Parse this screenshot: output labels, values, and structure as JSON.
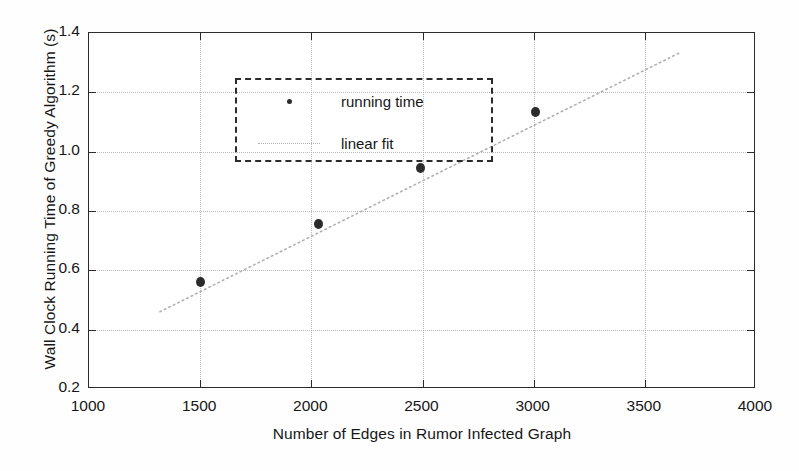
{
  "chart_data": {
    "type": "scatter",
    "title": "",
    "xlabel": "Number of Edges in Rumor Infected Graph",
    "ylabel": "Wall Clock Running Time of Greedy Algorithm (s)",
    "xlim": [
      1000,
      4000
    ],
    "ylim": [
      0.2,
      1.4
    ],
    "xticks": [
      1000,
      1500,
      2000,
      2500,
      3000,
      3500,
      4000
    ],
    "xtick_labels": [
      "1000",
      "1500",
      "2000",
      "2500",
      "3000",
      "3500",
      "4000"
    ],
    "yticks": [
      0.2,
      0.4,
      0.6,
      0.8,
      1.0,
      1.2,
      1.4
    ],
    "ytick_labels": [
      "0.2",
      "0.4",
      "0.6",
      "0.8",
      "1.0",
      "1.2",
      "1.4"
    ],
    "grid": true,
    "grid_style": "dotted",
    "legend_position": "upper left",
    "series": [
      {
        "name": "running time",
        "type": "scatter",
        "marker": "circle",
        "color": "#2b2b2b",
        "x": [
          1500,
          2030,
          2490,
          3010
        ],
        "y": [
          0.56,
          0.755,
          0.945,
          1.135
        ]
      },
      {
        "name": "linear fit",
        "type": "line",
        "style": "dotted",
        "color": "#b0b0b0",
        "x": [
          1320,
          3670
        ],
        "y": [
          0.455,
          1.335
        ]
      }
    ]
  },
  "legend": {
    "items": [
      {
        "label": "running time",
        "key": "marker-dot-icon"
      },
      {
        "label": "linear fit",
        "key": "dotted-line-icon"
      }
    ]
  },
  "colors": {
    "axis": "#2b2b2b",
    "grid": "#b9b9b9",
    "marker": "#2b2b2b",
    "fit": "#b0b0b0",
    "background": "#ffffff"
  }
}
